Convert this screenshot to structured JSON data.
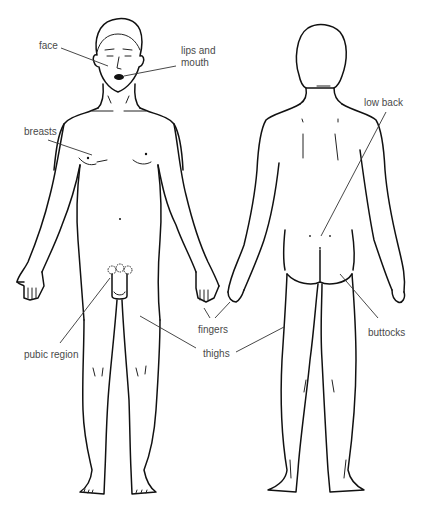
{
  "diagram": {
    "type": "anatomical-line-drawing",
    "figures": [
      {
        "id": "front",
        "view": "front view of standing male"
      },
      {
        "id": "back",
        "view": "back view of standing male"
      }
    ],
    "labels": [
      {
        "id": "face",
        "text": "face",
        "x": 39,
        "y": 40
      },
      {
        "id": "lips-mouth",
        "text": "lips and\nmouth",
        "x": 181,
        "y": 45
      },
      {
        "id": "breasts",
        "text": "breasts",
        "x": 24,
        "y": 126
      },
      {
        "id": "low-back",
        "text": "low back",
        "x": 364,
        "y": 97
      },
      {
        "id": "pubic-region",
        "text": "pubic region",
        "x": 24,
        "y": 349
      },
      {
        "id": "fingers",
        "text": "fingers",
        "x": 198,
        "y": 324
      },
      {
        "id": "thighs",
        "text": "thighs",
        "x": 203,
        "y": 348
      },
      {
        "id": "buttocks",
        "text": "buttocks",
        "x": 368,
        "y": 327
      }
    ],
    "colors": {
      "line": "#111111",
      "label": "#4a4a4a",
      "background": "#ffffff"
    }
  }
}
